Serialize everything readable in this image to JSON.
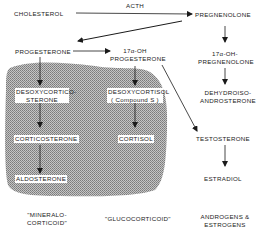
{
  "diagram": {
    "enzyme_label": "ACTH",
    "nodes": {
      "cholesterol": "CHOLESTEROL",
      "pregnenolone": "PREGNENOLONE",
      "progesterone": "PROGESTERONE",
      "oh_progesterone_1": "17α-OH",
      "oh_progesterone_2": "PROGESTERONE",
      "oh_pregnenolone_1": "17α-OH-",
      "oh_pregnenolone_2": "PREGNENOLONE",
      "desoxycorticosterone_1": "DESOXYCORTICO-",
      "desoxycorticosterone_2": "STERONE",
      "desoxycortisol_1": "DESOXYCORTISOL",
      "desoxycortisol_2": "( Compound S )",
      "dehydroisoandrosterone_1": "DEHYDROISO-",
      "dehydroisoandrosterone_2": "ANDROSTERONE",
      "corticosterone": "CORTICOSTERONE",
      "cortisol": "CORTISOL",
      "testosterone": "TESTOSTERONE",
      "aldosterone": "ALDOSTERONE",
      "estradiol": "ESTRADIOL"
    },
    "categories": {
      "mineralocorticoid_1": "\"MINERALO-",
      "mineralocorticoid_2": "CORTICOID\"",
      "glucocorticoid": "\"GLUCOCORTICOID\"",
      "androgens_1": "ANDROGENS &",
      "androgens_2": "ESTROGENS"
    },
    "colors": {
      "shaded_region": "#a8a8a8",
      "line": "#1a1a1a"
    }
  }
}
